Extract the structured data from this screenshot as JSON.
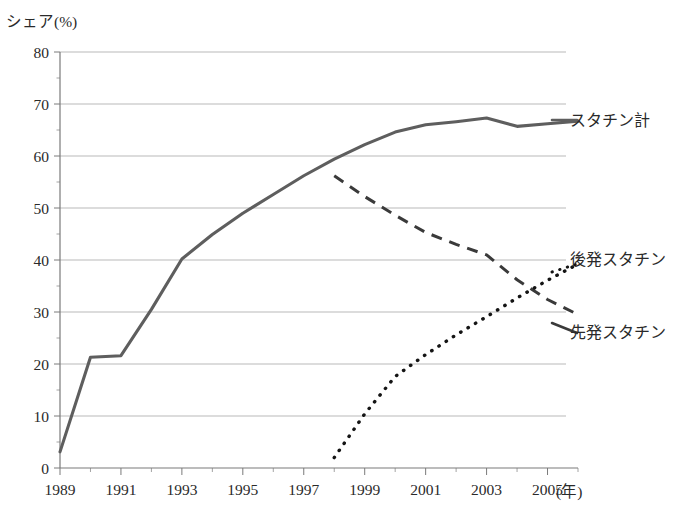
{
  "chart_data": {
    "type": "line",
    "title": "",
    "ylabel": "シェア(%)",
    "xlabel": "(年)",
    "ylim": [
      0,
      80
    ],
    "ytick_step": 10,
    "yticks": [
      "0",
      "10",
      "20",
      "30",
      "40",
      "50",
      "60",
      "70",
      "80"
    ],
    "xlim": [
      1989,
      2006
    ],
    "xticks": [
      "1989",
      "1991",
      "1993",
      "1995",
      "1997",
      "1999",
      "2001",
      "2003",
      "2005"
    ],
    "xtick_values": [
      1989,
      1991,
      1993,
      1995,
      1997,
      1999,
      2001,
      2003,
      2005
    ],
    "grid": "horizontal",
    "legend_position": "right-inline",
    "series": [
      {
        "name": "スタチン計",
        "style": "solid",
        "color": "#5e5e5e",
        "x": [
          1989,
          1990,
          1991,
          1992,
          1993,
          1994,
          1995,
          1996,
          1997,
          1998,
          1999,
          2000,
          2001,
          2002,
          2003,
          2004,
          2005,
          2006
        ],
        "values": [
          3.1,
          21.3,
          21.6,
          30.5,
          40.2,
          44.9,
          49.0,
          52.6,
          56.2,
          59.4,
          62.2,
          64.6,
          66.0,
          66.6,
          67.3,
          65.7,
          66.2,
          66.7
        ]
      },
      {
        "name": "先発スタチン",
        "style": "dashed",
        "color": "#3a3a3a",
        "x": [
          1998,
          1999,
          2000,
          2001,
          2002,
          2003,
          2004,
          2005,
          2006
        ],
        "values": [
          56.2,
          52.2,
          48.6,
          45.3,
          43.0,
          41.0,
          36.2,
          32.4,
          29.5
        ]
      },
      {
        "name": "後発スタチン",
        "style": "dotted",
        "color": "#141414",
        "x": [
          1998,
          1999,
          2000,
          2001,
          2002,
          2003,
          2004,
          2005,
          2006
        ],
        "values": [
          2.0,
          10.4,
          17.6,
          21.8,
          25.6,
          29.1,
          32.7,
          36.1,
          39.2
        ]
      }
    ]
  },
  "labels": {
    "ylabel": "シェア(%)",
    "xlabel": "(年)",
    "series_total": "スタチン計",
    "series_generic": "後発スタチン",
    "series_brand": "先発スタチン"
  }
}
